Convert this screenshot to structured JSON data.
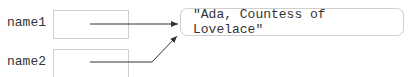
{
  "variables": [
    {
      "name": "name1"
    },
    {
      "name": "name2"
    }
  ],
  "value": {
    "text": "\"Ada, Countess of Lovelace\""
  },
  "colors": {
    "line": "#333333",
    "border": "#cfcfcf"
  }
}
